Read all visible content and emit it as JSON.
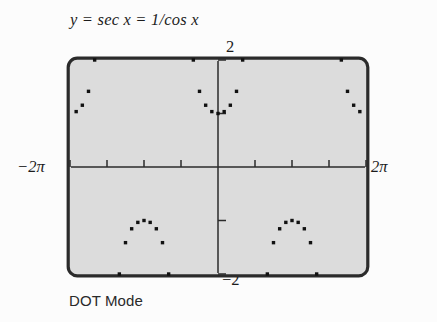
{
  "figure": {
    "title": "y = sec x = 1/cos x",
    "caption": "DOT Mode",
    "labels": {
      "top": "2",
      "bottom": "−2",
      "left": "−2π",
      "right": "2π"
    },
    "colors": {
      "screen_fill": "#dcdcdc",
      "screen_border": "#2b2b2b",
      "axis": "#2b2b2b",
      "plot_dots": "#111111",
      "page_background": "#fcfcfc",
      "text": "#1c1c1c"
    }
  },
  "chart_data": {
    "type": "scatter",
    "title": "y = sec x = 1/cos x",
    "subtitle": "DOT Mode",
    "xlabel": "x",
    "ylabel": "y",
    "xlim": [
      -6.283185307,
      6.283185307
    ],
    "ylim": [
      -2,
      2
    ],
    "xtick_labels": [
      "−2π",
      "2π"
    ],
    "ytick_labels": [
      "2",
      "−2"
    ],
    "xticks": [
      -6.283185307,
      -4.71238898,
      -3.141592653,
      -1.570796326,
      0,
      1.570796326,
      3.141592653,
      4.71238898,
      6.283185307
    ],
    "yticks": [
      -2,
      -1,
      1,
      2
    ],
    "grid": false,
    "legend": false,
    "function": "y = sec(x) = 1/cos(x)",
    "asymptotes": [
      -4.71238898,
      -1.570796326,
      1.570796326,
      4.71238898
    ],
    "render_mode": "dot",
    "dot_step_x": 0.2617993878,
    "series": [
      {
        "name": "sec x branch 1 (-2π .. -3π/2)",
        "x": [
          -6.283185307,
          -6.021385919,
          -5.759586532,
          -5.497787144,
          -5.235987756
        ],
        "y": [
          1.0,
          1.035276,
          1.154701,
          1.414214,
          2.0
        ]
      },
      {
        "name": "sec x branch 2 (-3π/2 .. -π/2), negative lobe",
        "x": [
          -4.188790205,
          -3.926990817,
          -3.665191429,
          -3.403392041,
          -3.141592653,
          -2.879793266,
          -2.617993878,
          -2.35619449,
          -2.094395102
        ],
        "y": [
          -2.0,
          -1.414214,
          -1.154701,
          -1.035276,
          -1.0,
          -1.035276,
          -1.154701,
          -1.414214,
          -2.0
        ]
      },
      {
        "name": "sec x branch 3 (-π/2 .. π/2), central lobe",
        "x": [
          -1.047197551,
          -0.785398163,
          -0.523598776,
          -0.261799388,
          0.0,
          0.261799388,
          0.523598776,
          0.785398163,
          1.047197551
        ],
        "y": [
          2.0,
          1.414214,
          1.154701,
          1.035276,
          1.0,
          1.035276,
          1.154701,
          1.414214,
          2.0
        ]
      },
      {
        "name": "sec x branch 4 (π/2 .. 3π/2), negative lobe",
        "x": [
          2.094395102,
          2.35619449,
          2.617993878,
          2.879793266,
          3.141592653,
          3.403392041,
          3.665191429,
          3.926990817,
          4.188790205
        ],
        "y": [
          -2.0,
          -1.414214,
          -1.154701,
          -1.035276,
          -1.0,
          -1.035276,
          -1.154701,
          -1.414214,
          -2.0
        ]
      },
      {
        "name": "sec x branch 5 (3π/2 .. 2π)",
        "x": [
          5.235987756,
          5.497787144,
          5.759586532,
          6.021385919,
          6.283185307
        ],
        "y": [
          2.0,
          1.414214,
          1.154701,
          1.035276,
          1.0
        ]
      }
    ]
  }
}
